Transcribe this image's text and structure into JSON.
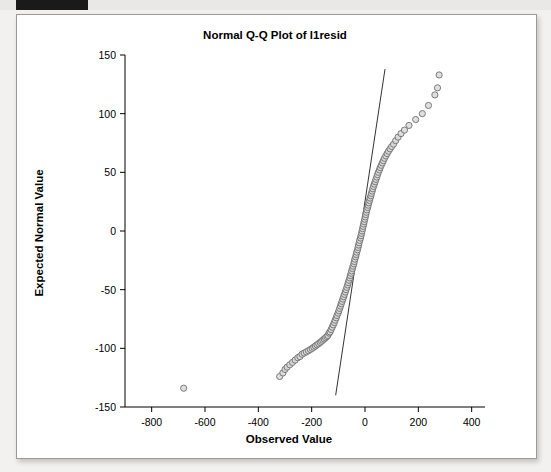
{
  "window": {
    "background_color": "#f2f1ef",
    "card_background": "#ffffff",
    "top_bar_color": "#1a1a1a"
  },
  "chart_data": {
    "type": "scatter",
    "title": "Normal Q-Q Plot of l1resid",
    "xlabel": "Observed Value",
    "ylabel": "Expected Normal Value",
    "xlim": [
      -900,
      450
    ],
    "ylim": [
      -150,
      150
    ],
    "xticks": [
      -800,
      -600,
      -400,
      -200,
      0,
      200,
      400
    ],
    "yticks": [
      -150,
      -100,
      -50,
      0,
      50,
      100,
      150
    ],
    "xtick_labels": [
      "-800",
      "-600",
      "-400",
      "-200",
      "0",
      "200",
      "400"
    ],
    "ytick_labels": [
      "-150",
      "-100",
      "-50",
      "0",
      "50",
      "100",
      "150"
    ],
    "grid": false,
    "legend": null,
    "marker": {
      "shape": "circle",
      "fill": "#d9d9d9",
      "edge": "#6f6f6f",
      "size": 5
    },
    "reference_line": {
      "style": "solid",
      "color": "#333333",
      "x": [
        -110,
        75
      ],
      "y": [
        -140,
        138
      ]
    },
    "series": [
      {
        "name": "l1resid",
        "x": [
          -680,
          -320,
          -308,
          -300,
          -292,
          -282,
          -272,
          -262,
          -252,
          -244,
          -236,
          -228,
          -220,
          -212,
          -205,
          -198,
          -192,
          -186,
          -180,
          -174,
          -168,
          -163,
          -158,
          -153,
          -148,
          -143,
          -139,
          -135,
          -131,
          -127,
          -123,
          -119,
          -115,
          -112,
          -108,
          -105,
          -101,
          -98,
          -95,
          -92,
          -89,
          -86,
          -83,
          -80,
          -77,
          -74,
          -71,
          -68,
          -65,
          -63,
          -60,
          -57,
          -55,
          -52,
          -50,
          -47,
          -45,
          -42,
          -40,
          -38,
          -35,
          -33,
          -31,
          -28,
          -26,
          -24,
          -22,
          -20,
          -17,
          -15,
          -13,
          -11,
          -9,
          -7,
          -5,
          -3,
          -1,
          1,
          3,
          5,
          7,
          10,
          12,
          14,
          17,
          19,
          22,
          24,
          27,
          29,
          32,
          35,
          38,
          41,
          44,
          47,
          50,
          54,
          57,
          61,
          65,
          69,
          73,
          78,
          83,
          88,
          94,
          100,
          107,
          115,
          124,
          135,
          148,
          165,
          190,
          215,
          238,
          262,
          272,
          278
        ],
        "y": [
          -134,
          -124,
          -121,
          -118,
          -116,
          -114,
          -112,
          -110,
          -108,
          -107,
          -105,
          -104,
          -103,
          -102,
          -101,
          -100,
          -99,
          -98,
          -97,
          -96,
          -95,
          -94,
          -93,
          -92,
          -91,
          -90,
          -89,
          -87,
          -86,
          -84,
          -82,
          -80,
          -78,
          -76,
          -74,
          -72,
          -70,
          -68,
          -66,
          -64,
          -62,
          -60,
          -58,
          -56,
          -54,
          -52,
          -50,
          -48,
          -46,
          -44,
          -42,
          -40,
          -38,
          -36,
          -34,
          -32,
          -30,
          -28,
          -26,
          -24,
          -22,
          -20,
          -18,
          -16,
          -14,
          -12,
          -10,
          -8,
          -6,
          -4,
          -2,
          0,
          2,
          4,
          6,
          8,
          10,
          12,
          14,
          16,
          18,
          20,
          22,
          24,
          26,
          28,
          30,
          32,
          34,
          36,
          38,
          40,
          42,
          44,
          46,
          48,
          50,
          52,
          54,
          56,
          58,
          60,
          62,
          64,
          66,
          68,
          70,
          72,
          74,
          77,
          80,
          83,
          86,
          90,
          95,
          100,
          107,
          116,
          122,
          133
        ]
      }
    ]
  }
}
